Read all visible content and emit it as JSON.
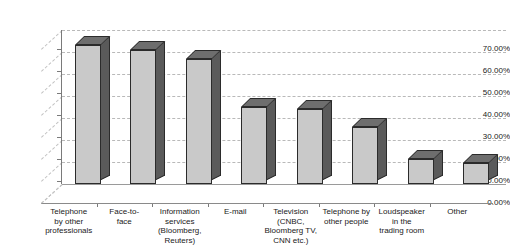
{
  "chart_data": {
    "type": "bar",
    "title": "",
    "subtitle": "",
    "xlabel": "",
    "ylabel": "",
    "categories": [
      "Telephone by other professionals",
      "Face-to-face",
      "Information services (Bloomberg, Reuters)",
      "E-mail",
      "Television (CNBC, Bloomberg TV, CNN etc.)",
      "Telephone by other people",
      "Loudspeaker in the trading room",
      "Other"
    ],
    "category_lines": [
      [
        "Telephone",
        "by other",
        "professionals"
      ],
      [
        "Face-to-",
        "face"
      ],
      [
        "Information",
        "services",
        "(Bloomberg,",
        "Reuters)"
      ],
      [
        "E-mail"
      ],
      [
        "Television",
        "(CNBC,",
        "Bloomberg TV,",
        "CNN etc.)"
      ],
      [
        "Telephone by",
        "other people"
      ],
      [
        "Loudspeaker",
        "in the",
        "trading room"
      ],
      [
        "Other"
      ]
    ],
    "values": [
      63,
      61,
      57,
      35,
      34,
      26,
      11.5,
      9.5
    ],
    "ylim": [
      0,
      70
    ],
    "ytick_values": [
      0,
      10,
      20,
      30,
      40,
      50,
      60,
      70
    ],
    "ytick_labels": [
      "0.00%",
      "10.00%",
      "20.00%",
      "30.00%",
      "40.00%",
      "50.00%",
      "60.00%",
      "70.00%"
    ],
    "grid": true,
    "legend": "none",
    "style": "3d-column",
    "colors": {
      "bar_front": "#c9c9c9",
      "bar_side": "#5a5a5a",
      "bar_top": "#6e6e6e",
      "bar_outline": "#2b2b2b",
      "gridline": "#b9b9b9",
      "axis": "#7a7a7a",
      "background": "#ffffff",
      "text": "#1a1a1a"
    }
  }
}
